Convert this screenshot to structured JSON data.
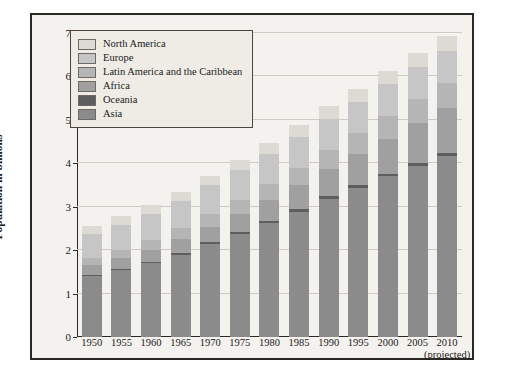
{
  "chart_data": {
    "type": "bar",
    "subtype": "stacked-bar",
    "title": "",
    "xlabel": "",
    "ylabel": "Population in billions",
    "ylim": [
      0,
      7
    ],
    "yticks": [
      0,
      1,
      2,
      3,
      4,
      5,
      6,
      7
    ],
    "grid": true,
    "legend_position": "top-left-inside",
    "categories": [
      "1950",
      "1955",
      "1960",
      "1965",
      "1970",
      "1975",
      "1980",
      "1985",
      "1990",
      "1995",
      "2000",
      "2005",
      "2010"
    ],
    "category_notes": {
      "2010": "(projected)"
    },
    "series": [
      {
        "name": "Asia",
        "color": "#8b8b8b",
        "values": [
          1.4,
          1.54,
          1.7,
          1.9,
          2.14,
          2.38,
          2.63,
          2.89,
          3.18,
          3.43,
          3.7,
          3.94,
          4.17
        ]
      },
      {
        "name": "Oceania",
        "color": "#5e5e5e",
        "values": [
          0.03,
          0.03,
          0.03,
          0.04,
          0.04,
          0.04,
          0.05,
          0.05,
          0.06,
          0.06,
          0.06,
          0.07,
          0.07
        ]
      },
      {
        "name": "Africa",
        "color": "#a0a0a0",
        "values": [
          0.23,
          0.25,
          0.28,
          0.32,
          0.36,
          0.42,
          0.48,
          0.56,
          0.63,
          0.72,
          0.81,
          0.92,
          1.03
        ]
      },
      {
        "name": "Latin America and the Caribbean",
        "color": "#b5b5b5",
        "values": [
          0.17,
          0.19,
          0.22,
          0.25,
          0.29,
          0.32,
          0.36,
          0.4,
          0.44,
          0.48,
          0.52,
          0.56,
          0.59
        ]
      },
      {
        "name": "Europe",
        "color": "#c6c6c6",
        "values": [
          0.55,
          0.58,
          0.6,
          0.63,
          0.66,
          0.68,
          0.69,
          0.71,
          0.72,
          0.73,
          0.73,
          0.73,
          0.73
        ]
      },
      {
        "name": "North America",
        "color": "#dddad4",
        "values": [
          0.17,
          0.19,
          0.2,
          0.21,
          0.23,
          0.24,
          0.25,
          0.27,
          0.28,
          0.3,
          0.31,
          0.33,
          0.34
        ]
      }
    ],
    "totals": [
      2.55,
      2.78,
      3.03,
      3.35,
      3.72,
      4.08,
      4.46,
      4.88,
      5.31,
      5.72,
      6.13,
      6.55,
      6.93
    ]
  },
  "legend": {
    "items": [
      {
        "label": "North America"
      },
      {
        "label": "Europe"
      },
      {
        "label": "Latin America and the Caribbean"
      },
      {
        "label": "Africa"
      },
      {
        "label": "Oceania"
      },
      {
        "label": "Asia"
      }
    ]
  }
}
